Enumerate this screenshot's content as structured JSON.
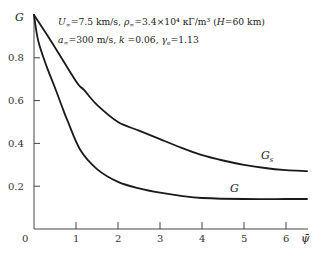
{
  "chart_data": {
    "type": "line",
    "title": "",
    "xlabel": "ψ̄",
    "ylabel": "G",
    "xlim": [
      0,
      6.6
    ],
    "ylim": [
      0,
      1.0
    ],
    "grid": false,
    "x_ticks": [
      "0",
      "1",
      "2",
      "3",
      "4",
      "5",
      "6"
    ],
    "y_ticks": [
      "0.2",
      "0.4",
      "0.6",
      "0.8"
    ],
    "annotations": [
      "U∞=7.5 km/s, ρ∞=3.4×10⁴ кГ/m³ (H=60 km)",
      "a∞=300 m/s, k =0.06, γₑ=1.13"
    ],
    "series": [
      {
        "name": "Gₛ",
        "x": [
          0,
          0.4,
          1.0,
          1.19,
          1.5,
          2.0,
          2.5,
          3.0,
          3.5,
          4.0,
          4.5,
          5.0,
          5.5,
          6.0,
          6.5
        ],
        "values": [
          1.0,
          0.88,
          0.69,
          0.65,
          0.58,
          0.5,
          0.46,
          0.42,
          0.38,
          0.345,
          0.32,
          0.3,
          0.285,
          0.275,
          0.27
        ]
      },
      {
        "name": "G",
        "x": [
          0,
          0.1,
          0.3,
          0.5,
          0.69,
          0.79,
          1.1,
          1.5,
          2.0,
          2.5,
          3.0,
          3.5,
          4.0,
          5.0,
          6.0,
          6.5
        ],
        "values": [
          1.0,
          0.88,
          0.76,
          0.66,
          0.56,
          0.51,
          0.37,
          0.28,
          0.22,
          0.19,
          0.17,
          0.155,
          0.145,
          0.14,
          0.14,
          0.14
        ]
      }
    ]
  },
  "labels": {
    "y_axis": "G",
    "x_axis": "ψ̄",
    "origin": "0",
    "series_gs": "Gₛ",
    "series_g": "G",
    "annot_line1_a": "U",
    "annot_line1_a_sub": "∞",
    "annot_line1_b": "=7.5 km/s, ",
    "annot_line1_c": "ρ",
    "annot_line1_c_sub": "∞",
    "annot_line1_d": "=3.4×10⁴ кΓ/m³ (",
    "annot_line1_e": "H",
    "annot_line1_f": "=60 km)",
    "annot_line2_a": "a",
    "annot_line2_a_sub": "∞",
    "annot_line2_b": "=300 m/s, ",
    "annot_line2_c": "k",
    "annot_line2_d": " =0.06, ",
    "annot_line2_e": "γ",
    "annot_line2_e_sub": "e",
    "annot_line2_f": "=1.13"
  },
  "colors": {
    "curve": "#1a1a1a",
    "axis": "#444444"
  }
}
